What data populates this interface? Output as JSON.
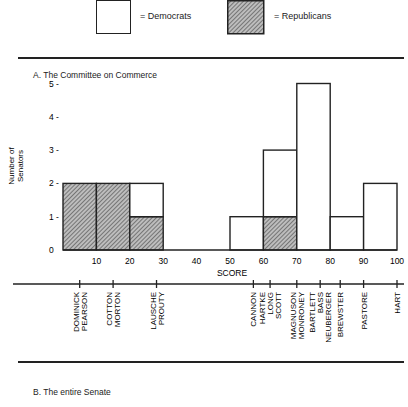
{
  "legend": {
    "democrats_label": "= Democrats",
    "republicans_label": "= Republicans"
  },
  "section_a": {
    "title": "A.  The Committee on Commerce"
  },
  "section_b": {
    "title": "B.  The entire Senate"
  },
  "colors": {
    "stroke": "#222222",
    "hatch": "#444444",
    "background": "#ffffff"
  },
  "chart_data": {
    "type": "bar",
    "subtype": "stacked histogram",
    "title": "A. The Committee on Commerce",
    "xlabel": "SCORE",
    "ylabel": "Number of Senators",
    "xlim": [
      0,
      100
    ],
    "ylim": [
      0,
      5
    ],
    "x_ticks": [
      10,
      20,
      30,
      40,
      50,
      60,
      70,
      80,
      90,
      100
    ],
    "y_ticks": [
      0,
      1,
      2,
      3,
      4,
      5
    ],
    "grid": false,
    "legend_position": "top",
    "bins": [
      "0-10",
      "10-20",
      "20-30",
      "30-40",
      "40-50",
      "50-60",
      "60-70",
      "70-80",
      "80-90",
      "90-100"
    ],
    "series": [
      {
        "name": "Republicans",
        "pattern": "hatched",
        "values": [
          2,
          2,
          1,
          0,
          0,
          0,
          1,
          0,
          0,
          0
        ]
      },
      {
        "name": "Democrats",
        "pattern": "white",
        "values": [
          0,
          0,
          1,
          0,
          0,
          1,
          2,
          5,
          1,
          2
        ]
      }
    ],
    "senator_labels": [
      {
        "group": [
          "DOMINICK",
          "PEARSON"
        ],
        "score": 5
      },
      {
        "group": [
          "COTTON",
          "MORTON"
        ],
        "score": 15
      },
      {
        "group": [
          "LAUSCHE",
          "PROUTY"
        ],
        "score": 28
      },
      {
        "group": [
          "CANNON"
        ],
        "score": 57
      },
      {
        "group": [
          "HARTKE",
          "LONG",
          "SCOTT"
        ],
        "score": 62
      },
      {
        "group": [
          "MAGNUSON",
          "MONRONEY"
        ],
        "score": 70
      },
      {
        "group": [
          "BARTLETT",
          "BASS",
          "NEUBERGER"
        ],
        "score": 77
      },
      {
        "group": [
          "BREWSTER"
        ],
        "score": 83
      },
      {
        "group": [
          "PASTORE"
        ],
        "score": 90
      },
      {
        "group": [
          "HART"
        ],
        "score": 100
      }
    ]
  }
}
